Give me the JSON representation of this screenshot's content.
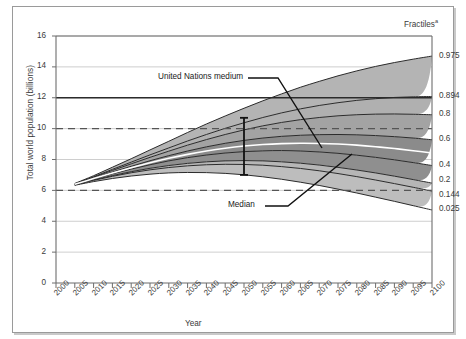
{
  "chart_data": {
    "type": "area",
    "title": "",
    "xlabel": "Year",
    "ylabel": "Total world population (billions)",
    "xlim": [
      2000,
      2100
    ],
    "ylim": [
      0,
      16
    ],
    "grid": true,
    "legend_position": "right-axis",
    "right_axis_title": "Fractiles",
    "right_axis_title_superscript": "a",
    "x_ticks": [
      "2000",
      "2005",
      "2010",
      "2015",
      "2020",
      "2025",
      "2030",
      "2035",
      "2040",
      "2045",
      "2050",
      "2055",
      "2060",
      "2065",
      "2070",
      "2075",
      "2080",
      "2085",
      "2090",
      "2095",
      "2100"
    ],
    "y_ticks": [
      "0",
      "2",
      "4",
      "6",
      "8",
      "10",
      "12",
      "14",
      "16"
    ],
    "fractile_labels": [
      "0.975",
      "0.894",
      "0.8",
      "0.6",
      "0.4",
      "0.2",
      "0.144",
      "0.025"
    ],
    "x": [
      2005,
      2010,
      2015,
      2020,
      2025,
      2030,
      2035,
      2040,
      2045,
      2050,
      2055,
      2060,
      2065,
      2070,
      2075,
      2080,
      2085,
      2090,
      2095,
      2100
    ],
    "series": [
      {
        "name": "0.975",
        "fractile": 0.975,
        "values": [
          6.45,
          6.95,
          7.5,
          8.05,
          8.62,
          9.18,
          9.75,
          10.3,
          10.82,
          11.32,
          11.8,
          12.25,
          12.68,
          13.06,
          13.42,
          13.74,
          14.03,
          14.28,
          14.5,
          14.7
        ]
      },
      {
        "name": "0.894",
        "fractile": 0.894,
        "values": [
          6.43,
          6.88,
          7.36,
          7.83,
          8.3,
          8.75,
          9.2,
          9.62,
          10.02,
          10.38,
          10.72,
          11.02,
          11.28,
          11.5,
          11.68,
          11.83,
          11.94,
          12.02,
          12.06,
          12.08
        ]
      },
      {
        "name": "0.8",
        "fractile": 0.8,
        "values": [
          6.42,
          6.85,
          7.29,
          7.72,
          8.14,
          8.54,
          8.93,
          9.29,
          9.62,
          9.92,
          10.18,
          10.4,
          10.58,
          10.72,
          10.83,
          10.9,
          10.94,
          10.95,
          10.93,
          10.9
        ]
      },
      {
        "name": "0.6",
        "fractile": 0.6,
        "values": [
          6.4,
          6.8,
          7.19,
          7.56,
          7.92,
          8.25,
          8.55,
          8.82,
          9.05,
          9.24,
          9.39,
          9.5,
          9.57,
          9.61,
          9.62,
          9.6,
          9.55,
          9.48,
          9.39,
          9.28
        ]
      },
      {
        "name": "Median",
        "fractile": 0.5,
        "values": [
          6.39,
          6.77,
          7.13,
          7.47,
          7.79,
          8.08,
          8.33,
          8.55,
          8.73,
          8.87,
          8.97,
          9.03,
          9.05,
          9.04,
          9.0,
          8.93,
          8.83,
          8.71,
          8.57,
          8.42
        ]
      },
      {
        "name": "0.4",
        "fractile": 0.4,
        "values": [
          6.38,
          6.74,
          7.07,
          7.38,
          7.66,
          7.91,
          8.12,
          8.29,
          8.42,
          8.51,
          8.56,
          8.58,
          8.55,
          8.49,
          8.4,
          8.28,
          8.14,
          7.98,
          7.8,
          7.61
        ]
      },
      {
        "name": "0.2",
        "fractile": 0.2,
        "values": [
          6.36,
          6.68,
          6.96,
          7.21,
          7.43,
          7.61,
          7.75,
          7.85,
          7.91,
          7.93,
          7.91,
          7.85,
          7.76,
          7.64,
          7.49,
          7.32,
          7.13,
          6.92,
          6.7,
          6.47
        ]
      },
      {
        "name": "0.144",
        "fractile": 0.144,
        "values": [
          6.35,
          6.65,
          6.91,
          7.14,
          7.33,
          7.48,
          7.59,
          7.66,
          7.69,
          7.68,
          7.63,
          7.54,
          7.42,
          7.27,
          7.09,
          6.89,
          6.67,
          6.44,
          6.2,
          5.95
        ]
      },
      {
        "name": "0.025",
        "fractile": 0.025,
        "values": [
          6.33,
          6.57,
          6.77,
          6.93,
          7.05,
          7.13,
          7.16,
          7.15,
          7.1,
          7.01,
          6.88,
          6.72,
          6.53,
          6.32,
          6.08,
          5.83,
          5.56,
          5.29,
          5.01,
          4.73
        ]
      }
    ],
    "reference_lines": [
      {
        "name": "United Nations medium",
        "style": "solid",
        "value": 12.0,
        "label": "United Nations medium"
      },
      {
        "name": "ten-billion-reference",
        "style": "dashed",
        "value": 10.0,
        "label": ""
      },
      {
        "name": "six-billion-reference",
        "style": "dashed",
        "value": 6.0,
        "label": ""
      }
    ],
    "error_bar": {
      "name": "uncertainty-range-2050",
      "x": 2050,
      "low": 7.0,
      "high": 10.7
    },
    "annotations": [
      {
        "name": "united-nations-medium-annotation",
        "text": "United Nations medium"
      },
      {
        "name": "median-annotation",
        "text": "Median"
      }
    ],
    "colors": {
      "band_975": "#b4b4b4",
      "band_894": "#b0b0b0",
      "band_80": "#a3a3a3",
      "band_60": "#8b8b8b",
      "band_40": "#8f8f8f",
      "band_20": "#b6b6b6",
      "band_144": "#bdbdbd",
      "band_025": "#c6c6c6",
      "median_line": "#ffffff",
      "outline": "#2b2b2b",
      "grid": "#b9b9b9",
      "axis": "#6d6d6d",
      "text": "#3a3a3a"
    }
  }
}
